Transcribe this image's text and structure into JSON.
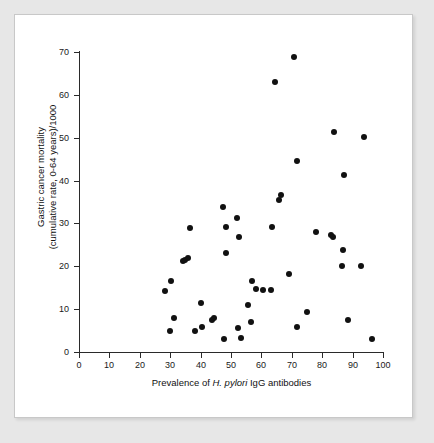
{
  "figure": {
    "background_color": "#e7e7e7",
    "paper_color": "#ffffff",
    "marker_color": "#111111"
  },
  "chart_data": {
    "type": "scatter",
    "title": "",
    "xlabel_parts": {
      "pre": "Prevalence of ",
      "italic": "H. pylori",
      "post": " IgG antibodies"
    },
    "xlabel": "Prevalence of H. pylori IgG antibodies",
    "ylabel_line1": "Gastric cancer mortality",
    "ylabel_line2": "(cumulative rate, 0-64 years)/1000",
    "ylabel": "Gastric cancer mortality (cumulative rate, 0-64 years)/1000",
    "xlim": [
      0,
      100
    ],
    "ylim": [
      0,
      70
    ],
    "xticks": [
      0,
      10,
      20,
      30,
      40,
      50,
      60,
      70,
      80,
      90,
      100
    ],
    "yticks": [
      0,
      10,
      20,
      30,
      40,
      50,
      60,
      70
    ],
    "xticklabels": [
      "0",
      "10",
      "20",
      "30",
      "40",
      "50",
      "60",
      "70",
      "80",
      "90",
      "100"
    ],
    "yticklabels": [
      "0",
      "10",
      "20",
      "30",
      "40",
      "50",
      "60",
      "70"
    ],
    "grid": false,
    "legend": null,
    "marker": "filled-circle",
    "points": [
      {
        "x": 28.2,
        "y": 14.3
      },
      {
        "x": 30.4,
        "y": 16.6
      },
      {
        "x": 30.0,
        "y": 5.0
      },
      {
        "x": 31.4,
        "y": 8.0
      },
      {
        "x": 34.2,
        "y": 21.3
      },
      {
        "x": 34.9,
        "y": 21.5
      },
      {
        "x": 36.0,
        "y": 22.0
      },
      {
        "x": 36.4,
        "y": 29.0
      },
      {
        "x": 38.0,
        "y": 4.9
      },
      {
        "x": 40.0,
        "y": 11.4
      },
      {
        "x": 40.3,
        "y": 5.9
      },
      {
        "x": 43.8,
        "y": 7.4
      },
      {
        "x": 44.5,
        "y": 7.9
      },
      {
        "x": 47.5,
        "y": 33.8
      },
      {
        "x": 47.8,
        "y": 3.0
      },
      {
        "x": 48.3,
        "y": 29.1
      },
      {
        "x": 48.5,
        "y": 23.0
      },
      {
        "x": 52.0,
        "y": 31.2
      },
      {
        "x": 52.2,
        "y": 5.5
      },
      {
        "x": 52.5,
        "y": 26.9
      },
      {
        "x": 53.4,
        "y": 3.3
      },
      {
        "x": 55.5,
        "y": 10.9
      },
      {
        "x": 56.7,
        "y": 6.9
      },
      {
        "x": 57.0,
        "y": 16.5
      },
      {
        "x": 58.2,
        "y": 14.7
      },
      {
        "x": 60.6,
        "y": 14.4
      },
      {
        "x": 63.0,
        "y": 14.4
      },
      {
        "x": 63.6,
        "y": 29.1
      },
      {
        "x": 64.4,
        "y": 62.9
      },
      {
        "x": 65.8,
        "y": 35.5
      },
      {
        "x": 66.5,
        "y": 36.6
      },
      {
        "x": 69.0,
        "y": 18.3
      },
      {
        "x": 70.6,
        "y": 68.9
      },
      {
        "x": 71.6,
        "y": 44.6
      },
      {
        "x": 71.8,
        "y": 5.9
      },
      {
        "x": 75.0,
        "y": 9.3
      },
      {
        "x": 77.9,
        "y": 28.1
      },
      {
        "x": 83.0,
        "y": 27.2
      },
      {
        "x": 83.5,
        "y": 26.8
      },
      {
        "x": 83.8,
        "y": 51.3
      },
      {
        "x": 86.5,
        "y": 20.1
      },
      {
        "x": 86.8,
        "y": 23.7
      },
      {
        "x": 87.2,
        "y": 41.4
      },
      {
        "x": 88.5,
        "y": 7.5
      },
      {
        "x": 92.6,
        "y": 20.1
      },
      {
        "x": 93.6,
        "y": 50.2
      },
      {
        "x": 96.3,
        "y": 3.1
      }
    ]
  }
}
